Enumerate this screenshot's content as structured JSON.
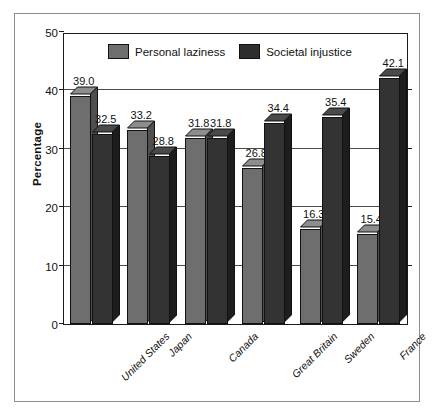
{
  "chart_data": {
    "type": "bar",
    "title": "",
    "xlabel": "",
    "ylabel": "Percentage",
    "ylim": [
      0,
      50
    ],
    "yticks": [
      0,
      10,
      20,
      30,
      40,
      50
    ],
    "ytick_labels": [
      "0",
      "10",
      "20",
      "30",
      "40",
      "50"
    ],
    "grid": true,
    "legend_position": "top-center",
    "categories": [
      "United States",
      "Japan",
      "Canada",
      "Great Britain",
      "Sweden",
      "France"
    ],
    "series": [
      {
        "name": "Personal laziness",
        "color": "#6e6e6e",
        "values": [
          39.0,
          33.2,
          31.8,
          26.8,
          16.3,
          15.4
        ],
        "labels": [
          "39.0",
          "33.2",
          "31.8",
          "26.8",
          "16.3",
          "15.4"
        ]
      },
      {
        "name": "Societal injustice",
        "color": "#333333",
        "values": [
          32.5,
          28.8,
          31.8,
          34.4,
          35.4,
          42.1
        ],
        "labels": [
          "32.5",
          "28.8",
          "31.8",
          "34.4",
          "35.4",
          "42.1"
        ]
      }
    ]
  },
  "legend": {
    "items": [
      {
        "label": "Personal laziness",
        "swatch": "light"
      },
      {
        "label": "Societal injustice",
        "swatch": "dark"
      }
    ]
  },
  "axis": {
    "y_title": "Percentage"
  }
}
